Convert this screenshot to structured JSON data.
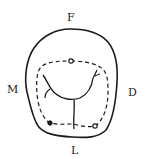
{
  "figure": {
    "labels": {
      "top": "F",
      "left": "M",
      "right": "D",
      "bottom": "L"
    },
    "colors": {
      "stroke": "#1a1a1a",
      "background": "#ffffff"
    },
    "elements": {
      "outer_outline": "solid crown outline",
      "inner_outline": "dashed marginal ridge outline",
      "grooves": "central groove with branching supplemental grooves",
      "pits": 3
    }
  }
}
